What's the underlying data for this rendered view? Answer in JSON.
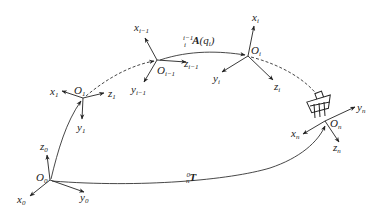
{
  "diagram": {
    "type": "robot-kinematic-chain-coordinate-frames",
    "frames": [
      {
        "id": "frame-0",
        "origin": {
          "base": "O",
          "sub": "0"
        },
        "axes": [
          {
            "base": "x",
            "sub": "0"
          },
          {
            "base": "y",
            "sub": "0"
          },
          {
            "base": "z",
            "sub": "0"
          }
        ]
      },
      {
        "id": "frame-1",
        "origin": {
          "base": "O",
          "sub": "1"
        },
        "axes": [
          {
            "base": "x",
            "sub": "1"
          },
          {
            "base": "y",
            "sub": "1"
          },
          {
            "base": "z",
            "sub": "1"
          }
        ]
      },
      {
        "id": "frame-i-1",
        "origin": {
          "base": "O",
          "sub": "i−1"
        },
        "axes": [
          {
            "base": "x",
            "sub": "i−1"
          },
          {
            "base": "y",
            "sub": "i−1"
          },
          {
            "base": "z",
            "sub": "i−1"
          }
        ]
      },
      {
        "id": "frame-i",
        "origin": {
          "base": "O",
          "sub": "i"
        },
        "axes": [
          {
            "base": "x",
            "sub": "i"
          },
          {
            "base": "y",
            "sub": "i"
          },
          {
            "base": "z",
            "sub": "i"
          }
        ]
      },
      {
        "id": "frame-n",
        "origin": {
          "base": "O",
          "sub": "n"
        },
        "axes": [
          {
            "base": "x",
            "sub": "n"
          },
          {
            "base": "y",
            "sub": "n"
          },
          {
            "base": "z",
            "sub": "n"
          }
        ]
      }
    ],
    "transforms": {
      "link": {
        "pre_sup": "i−1",
        "pre_sub": "i",
        "symbol": "A",
        "arg": "(q",
        "arg_sub": "i",
        "close": ")"
      },
      "total": {
        "pre_sup": "0",
        "pre_sub": "n",
        "symbol": "T"
      }
    },
    "end_effector": "gripper"
  }
}
